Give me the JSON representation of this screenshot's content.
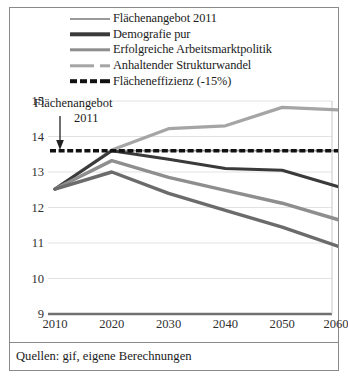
{
  "figure": {
    "caption": "Quellen: gif, eigene Berechnungen"
  },
  "annotation": {
    "line1": "Flächenangebot",
    "line2": "2011",
    "icon": "down-arrow-icon"
  },
  "legend": {
    "items": [
      {
        "label": "Flächenangebot 2011",
        "color": "#9a9a9a",
        "style": "solid",
        "width": 1.8
      },
      {
        "label": "Demografie pur",
        "color": "#3a3a3a",
        "style": "solid",
        "width": 3.2
      },
      {
        "label": "Erfolgreiche Arbeitsmarktpolitik",
        "color": "#8e8e8e",
        "style": "solid",
        "width": 3.2
      },
      {
        "label": "Anhaltender Strukturwandel",
        "color": "#a5a5a5",
        "style": "dashed-long",
        "width": 3.2
      },
      {
        "label": "Flächeneffizienz (-15%)",
        "color": "#111111",
        "style": "dashed",
        "width": 3.4
      }
    ]
  },
  "chart_data": {
    "type": "line",
    "title": "",
    "xlabel": "",
    "ylabel": "",
    "x": [
      2010,
      2020,
      2030,
      2040,
      2050,
      2060
    ],
    "xticklabels": [
      "2010",
      "2020",
      "2030",
      "2040",
      "2050",
      "2060"
    ],
    "yticklabels": [
      "15",
      "14",
      "13",
      "12",
      "11",
      "10",
      "9"
    ],
    "yticks": [
      15,
      14,
      13,
      12,
      11,
      10,
      9
    ],
    "xlim": [
      2010,
      2060
    ],
    "ylim": [
      9,
      15
    ],
    "grid": true,
    "legend_position": "top",
    "series": [
      {
        "name": "Flächenangebot 2011",
        "color": "#9a9a9a",
        "style": "solid",
        "width": 1.8,
        "values": [
          12.52,
          13.6,
          13.6,
          13.6,
          13.6,
          13.6
        ]
      },
      {
        "name": "Anhaltender Strukturwandel",
        "color": "#a5a5a5",
        "style": "solid",
        "width": 3.2,
        "values": [
          12.52,
          13.62,
          14.22,
          14.3,
          14.82,
          14.75
        ]
      },
      {
        "name": "Demografie pur",
        "color": "#3a3a3a",
        "style": "solid",
        "width": 3.0,
        "values": [
          12.52,
          13.6,
          13.36,
          13.1,
          13.05,
          12.58
        ]
      },
      {
        "name": "Erfolgreiche Arbeitsmarktpolitik",
        "color": "#8e8e8e",
        "style": "solid",
        "width": 3.4,
        "values": [
          12.52,
          13.32,
          12.85,
          12.48,
          12.12,
          11.65
        ]
      },
      {
        "name": "Flächeneffizienz Szenario",
        "color": "#6b6b6b",
        "style": "solid",
        "width": 3.4,
        "values": [
          12.52,
          13.0,
          12.4,
          11.92,
          11.45,
          10.9
        ]
      },
      {
        "name": "Flächeneffizienz (-15%)",
        "color": "#111111",
        "style": "dashed",
        "width": 3.4,
        "values": [
          13.6,
          13.6,
          13.6,
          13.6,
          13.6,
          13.6
        ]
      }
    ]
  }
}
